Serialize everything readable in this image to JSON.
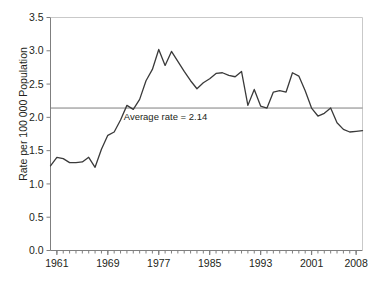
{
  "chart_data": {
    "type": "line",
    "title": "",
    "xlabel": "",
    "ylabel": "Rate per 100 000 Population",
    "xlim": [
      1960,
      2009
    ],
    "ylim": [
      0.0,
      3.5
    ],
    "grid": false,
    "legend": null,
    "y_ticks": [
      "0.0",
      "0.5",
      "1.0",
      "1.5",
      "2.0",
      "2.5",
      "3.0",
      "3.5"
    ],
    "y_tick_values": [
      0.0,
      0.5,
      1.0,
      1.5,
      2.0,
      2.5,
      3.0,
      3.5
    ],
    "x_ticks": [
      "1961",
      "1969",
      "1977",
      "1985",
      "1993",
      "2001",
      "2008"
    ],
    "x_tick_values": [
      1961,
      1969,
      1977,
      1985,
      1993,
      2001,
      2008
    ],
    "x_minor_tick_step": 1,
    "annotations": [
      {
        "name": "average-rate-line",
        "text": "Average rate = 2.14",
        "value": 2.14,
        "orientation": "horizontal",
        "color": "#7f7f7f",
        "text_x": 1971.5,
        "text_y": 2.0
      }
    ],
    "series": [
      {
        "name": "rate",
        "color": "#3a3a3a",
        "x": [
          1960,
          1961,
          1962,
          1963,
          1964,
          1965,
          1966,
          1967,
          1968,
          1969,
          1970,
          1971,
          1972,
          1973,
          1974,
          1975,
          1976,
          1977,
          1978,
          1979,
          1980,
          1981,
          1982,
          1983,
          1984,
          1985,
          1986,
          1987,
          1988,
          1989,
          1990,
          1991,
          1992,
          1993,
          1994,
          1995,
          1996,
          1997,
          1998,
          1999,
          2000,
          2001,
          2002,
          2003,
          2004,
          2005,
          2006,
          2007,
          2008,
          2009
        ],
        "values": [
          1.27,
          1.4,
          1.38,
          1.32,
          1.32,
          1.33,
          1.4,
          1.25,
          1.52,
          1.73,
          1.78,
          1.96,
          2.18,
          2.12,
          2.27,
          2.55,
          2.72,
          3.02,
          2.78,
          2.99,
          2.84,
          2.69,
          2.55,
          2.43,
          2.52,
          2.58,
          2.66,
          2.67,
          2.63,
          2.61,
          2.69,
          2.18,
          2.42,
          2.17,
          2.14,
          2.38,
          2.4,
          2.38,
          2.67,
          2.62,
          2.4,
          2.14,
          2.02,
          2.06,
          2.14,
          1.92,
          1.82,
          1.78,
          1.79,
          1.8
        ]
      }
    ],
    "series_extra_points": {
      "note": "",
      "x": [
        2010,
        2011,
        2012,
        2013,
        2014
      ],
      "values": [
        1.87,
        1.74,
        1.95,
        2.05,
        1.83
      ]
    }
  },
  "axes": {
    "spine_color": "#7f7f7f",
    "tick_color": "#7f7f7f",
    "text_color": "#231f20"
  }
}
